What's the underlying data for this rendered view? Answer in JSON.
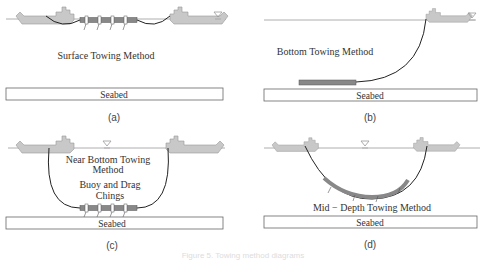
{
  "panels": [
    {
      "id": "a",
      "label": "(a)",
      "title": "Surface Towing Method",
      "seabed": "Seabed"
    },
    {
      "id": "b",
      "label": "(b)",
      "title": "Bottom Towing Method",
      "seabed": "Seabed"
    },
    {
      "id": "c",
      "label": "(c)",
      "title_line1": "Near Bottom Towing",
      "title_line2": "Method",
      "note_line1": "Buoy and Drag",
      "note_line2": "Chings",
      "seabed": "Seabed"
    },
    {
      "id": "d",
      "label": "(d)",
      "title": "Mid − Depth Towing Method",
      "seabed": "Seabed"
    }
  ],
  "caption": "Figure 5. Towing method diagrams",
  "colors": {
    "ship": "#c8c8c8",
    "cable": "#222222",
    "structure": "#888888",
    "seabed_border": "#555555"
  }
}
